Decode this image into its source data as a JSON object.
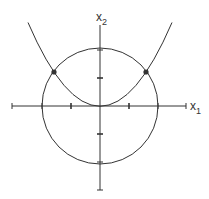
{
  "diagram": {
    "axes": {
      "x_label": "x",
      "x_subscript": "1",
      "y_label": "x",
      "y_subscript": "2"
    },
    "colors": {
      "stroke": "#333333",
      "background": "#ffffff"
    },
    "elements": [
      {
        "type": "circle",
        "center": [
          0,
          0
        ],
        "radius": 2
      },
      {
        "type": "parabola",
        "vertex": [
          0,
          0
        ],
        "opens": "up"
      },
      {
        "type": "intersection-points",
        "count": 2
      }
    ],
    "ticks": {
      "x": [
        -3,
        -2,
        -1,
        1,
        2
      ],
      "y": [
        -3,
        -2,
        -1,
        1,
        2
      ]
    }
  }
}
